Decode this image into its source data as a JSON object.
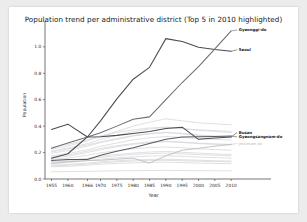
{
  "chart_data": {
    "type": "line",
    "title": "Population trend per administrative district (Top 5 in 2010 highlighted)",
    "xlabel": "Year",
    "ylabel": "Population",
    "xlim": [
      1953,
      2013
    ],
    "ylim": [
      0.0,
      1.15
    ],
    "grid": false,
    "legend_position": "inline-right-annotations",
    "x": [
      1955,
      1960,
      1966,
      1970,
      1975,
      1980,
      1985,
      1990,
      1995,
      2000,
      2005,
      2010
    ],
    "xticks": [
      "1955",
      "1960",
      "1966",
      "1970",
      "1975",
      "1980",
      "1985",
      "1990",
      "1995",
      "2000",
      "2005",
      "2010"
    ],
    "yticks": [
      "0.0",
      "0.2",
      "0.4",
      "0.6",
      "0.8",
      "1.0"
    ],
    "highlight_color": "#4d4d55",
    "faded_color": "#d5d5d8",
    "highlighted_series": [
      {
        "name": "Seoul",
        "label": "Seoul",
        "color": "#4a4a52",
        "values": [
          0.157,
          0.191,
          0.318,
          0.44,
          0.606,
          0.755,
          0.845,
          1.062,
          1.04,
          0.997,
          0.979,
          0.966
        ],
        "label_y": 0.978
      },
      {
        "name": "Gyeonggi-do",
        "label": "Gyeonggi-do",
        "color": "#6c6c75",
        "values": [
          0.232,
          0.272,
          0.318,
          0.35,
          0.4,
          0.452,
          0.47,
          0.601,
          0.73,
          0.85,
          0.985,
          1.12
        ],
        "label_y": 1.128
      },
      {
        "name": "Busan",
        "label": "Busan",
        "color": "#4a4a52",
        "values": [
          0.375,
          0.415,
          0.318,
          0.32,
          0.33,
          0.345,
          0.36,
          0.382,
          0.392,
          0.3,
          0.31,
          0.318
        ],
        "label_y": 0.352
      },
      {
        "name": "Gyeongsangnam-do",
        "label": "Gyeongsangnam-do",
        "color": "#5a5a63",
        "values": [
          0.14,
          0.148,
          0.147,
          0.18,
          0.21,
          0.236,
          0.268,
          0.3,
          0.318,
          0.32,
          0.322,
          0.325
        ],
        "label_y": 0.318
      },
      {
        "name": "Jeollanam-do",
        "label": "Jeollanam-do",
        "color": "#b9b9bf",
        "values": [
          0.118,
          0.13,
          0.14,
          0.142,
          0.15,
          0.158,
          0.12,
          0.175,
          0.218,
          0.232,
          0.248,
          0.262
        ],
        "label_y": 0.268
      }
    ],
    "background_series": [
      {
        "name": "bg-01",
        "values": [
          0.225,
          0.25,
          0.29,
          0.32,
          0.36,
          0.4,
          0.43,
          0.455,
          0.44,
          0.425,
          0.418,
          0.41
        ]
      },
      {
        "name": "bg-02",
        "values": [
          0.21,
          0.235,
          0.268,
          0.3,
          0.33,
          0.358,
          0.378,
          0.392,
          0.38,
          0.368,
          0.36,
          0.352
        ]
      },
      {
        "name": "bg-03",
        "values": [
          0.195,
          0.215,
          0.248,
          0.275,
          0.3,
          0.325,
          0.342,
          0.352,
          0.345,
          0.332,
          0.325,
          0.32
        ]
      },
      {
        "name": "bg-04",
        "values": [
          0.175,
          0.192,
          0.222,
          0.248,
          0.272,
          0.296,
          0.312,
          0.322,
          0.315,
          0.305,
          0.3,
          0.295
        ]
      },
      {
        "name": "bg-05",
        "values": [
          0.16,
          0.172,
          0.2,
          0.222,
          0.244,
          0.262,
          0.275,
          0.282,
          0.276,
          0.268,
          0.262,
          0.258
        ]
      },
      {
        "name": "bg-06",
        "values": [
          0.148,
          0.158,
          0.18,
          0.198,
          0.215,
          0.228,
          0.238,
          0.242,
          0.236,
          0.228,
          0.222,
          0.218
        ]
      },
      {
        "name": "bg-07",
        "values": [
          0.132,
          0.14,
          0.158,
          0.172,
          0.186,
          0.196,
          0.204,
          0.208,
          0.202,
          0.196,
          0.19,
          0.186
        ]
      },
      {
        "name": "bg-08",
        "values": [
          0.118,
          0.124,
          0.138,
          0.15,
          0.16,
          0.168,
          0.174,
          0.176,
          0.172,
          0.166,
          0.162,
          0.158
        ]
      },
      {
        "name": "bg-09",
        "values": [
          0.105,
          0.11,
          0.12,
          0.13,
          0.138,
          0.144,
          0.148,
          0.15,
          0.146,
          0.142,
          0.138,
          0.136
        ]
      },
      {
        "name": "bg-10",
        "values": [
          0.092,
          0.096,
          0.104,
          0.112,
          0.118,
          0.122,
          0.126,
          0.128,
          0.124,
          0.12,
          0.118,
          0.116
        ]
      },
      {
        "name": "bg-11",
        "values": [
          0.055,
          0.056,
          0.058,
          0.06,
          0.062,
          0.063,
          0.064,
          0.065,
          0.064,
          0.063,
          0.062,
          0.062
        ]
      },
      {
        "name": "bg-12",
        "values": [
          0.24,
          0.262,
          0.296,
          0.326,
          0.352,
          0.372,
          0.386,
          0.392,
          0.382,
          0.372,
          0.366,
          0.36
        ]
      },
      {
        "name": "bg-13",
        "values": [
          0.205,
          0.228,
          0.258,
          0.282,
          0.306,
          0.328,
          0.344,
          0.352,
          0.342,
          0.33,
          0.322,
          0.316
        ]
      },
      {
        "name": "bg-14",
        "values": [
          0.168,
          0.182,
          0.21,
          0.232,
          0.252,
          0.268,
          0.28,
          0.286,
          0.28,
          0.272,
          0.266,
          0.262
        ]
      },
      {
        "name": "bg-15",
        "values": [
          0.126,
          0.134,
          0.15,
          0.164,
          0.176,
          0.186,
          0.192,
          0.196,
          0.19,
          0.184,
          0.18,
          0.176
        ]
      },
      {
        "name": "bg-16",
        "values": [
          0.1,
          0.104,
          0.114,
          0.122,
          0.13,
          0.136,
          0.14,
          0.142,
          0.138,
          0.134,
          0.132,
          0.13
        ]
      }
    ]
  }
}
